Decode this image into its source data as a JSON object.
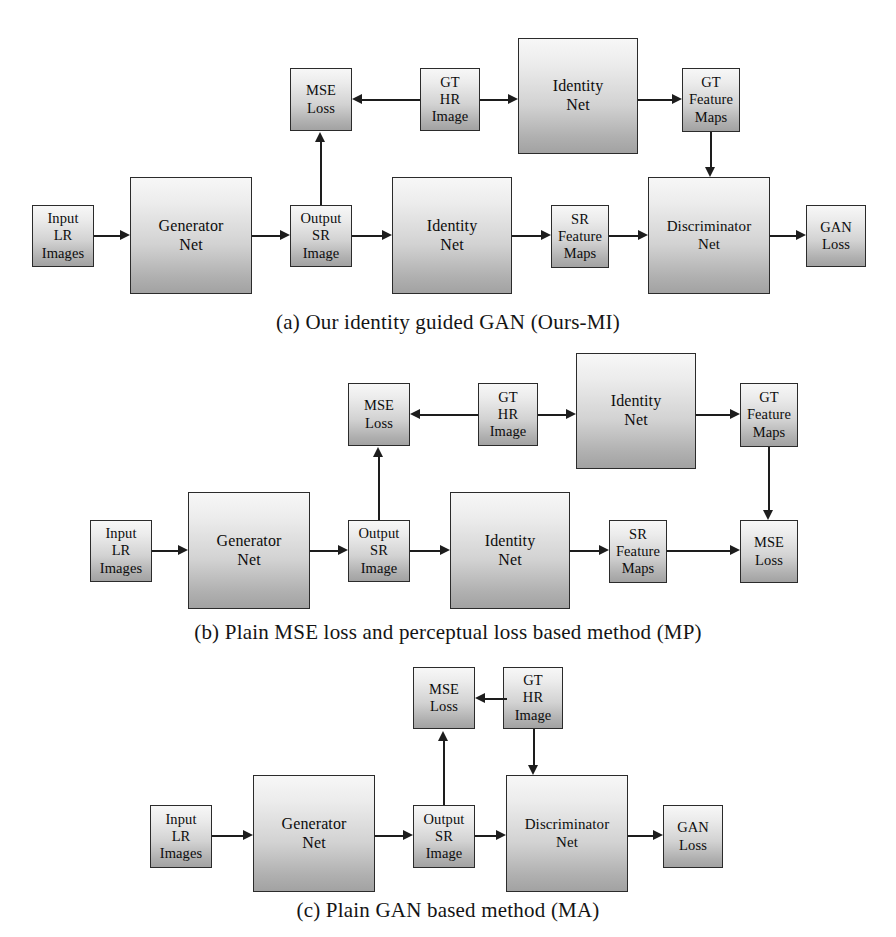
{
  "figure": {
    "background_color": "#ffffff",
    "node_fill_top": "#f7f7f7",
    "node_fill_bottom": "#a2a2a2",
    "node_border_color": "#2b2b2b",
    "edge_color": "#1d1d1d"
  },
  "panels": [
    {
      "id": "a",
      "caption": "(a) Our identity guided GAN (Ours-MI)",
      "nodes": {
        "input_lr_images": "Input\nLR\nImages",
        "generator_net": "Generator\nNet",
        "output_sr_image": "Output\nSR\nImage",
        "mse_loss": "MSE\nLoss",
        "gt_hr_image": "GT\nHR\nImage",
        "identity_net_top": "Identity\nNet",
        "gt_feature_maps": "GT\nFeature\nMaps",
        "identity_net_bottom": "Identity\nNet",
        "sr_feature_maps": "SR\nFeature\nMaps",
        "discriminator_net": "Discriminator\nNet",
        "gan_loss": "GAN\nLoss"
      }
    },
    {
      "id": "b",
      "caption": "(b) Plain MSE loss and perceptual loss based method (MP)",
      "nodes": {
        "input_lr_images": "Input\nLR\nImages",
        "generator_net": "Generator\nNet",
        "output_sr_image": "Output\nSR\nImage",
        "mse_loss_top": "MSE\nLoss",
        "gt_hr_image": "GT\nHR\nImage",
        "identity_net_top": "Identity\nNet",
        "gt_feature_maps": "GT\nFeature\nMaps",
        "identity_net_bottom": "Identity\nNet",
        "sr_feature_maps": "SR\nFeature\nMaps",
        "mse_loss_right": "MSE\nLoss"
      }
    },
    {
      "id": "c",
      "caption": "(c) Plain GAN based method (MA)",
      "nodes": {
        "input_lr_images": "Input\nLR\nImages",
        "generator_net": "Generator\nNet",
        "output_sr_image": "Output\nSR\nImage",
        "mse_loss": "MSE\nLoss",
        "gt_hr_image": "GT\nHR\nImage",
        "discriminator_net": "Discriminator\nNet",
        "gan_loss": "GAN\nLoss"
      }
    }
  ]
}
